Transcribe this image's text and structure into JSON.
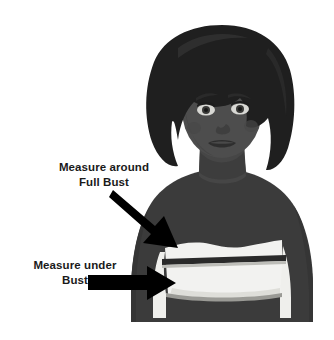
{
  "diagram": {
    "background_color": "#ffffff",
    "palette": {
      "background": "#ffffff",
      "hair": "#1f1f1f",
      "skin": "#4d4d4d",
      "skin_shadow": "#414141",
      "body": "#3b3b3b",
      "band_light": "#f2f2f0",
      "band_edge": "#c9c9c4",
      "band_stripe": "#2a2a2a",
      "arrow": "#000000",
      "text": "#1a1a1a"
    }
  },
  "callouts": [
    {
      "id": "full-bust",
      "line_1": "Measure around",
      "line_2": "Full Bust",
      "arrow": "diagonal-down-right-arrow",
      "points_to": "full-bust-band-top"
    },
    {
      "id": "under-bust",
      "line_1": "Measure under",
      "line_2": "Bust",
      "arrow": "horizontal-right-arrow",
      "points_to": "under-bust-band-bottom"
    }
  ],
  "figure_parts": {
    "hair": "hair-shape",
    "face": "face-shape",
    "left_eye": "left-eye",
    "right_eye": "right-eye",
    "left_brow": "left-eyebrow",
    "right_brow": "right-eyebrow",
    "nose": "nose",
    "lips": "lips",
    "neck": "neck",
    "torso": "torso",
    "bust_band": "bust-band",
    "band_stripe": "band-measure-stripe"
  }
}
